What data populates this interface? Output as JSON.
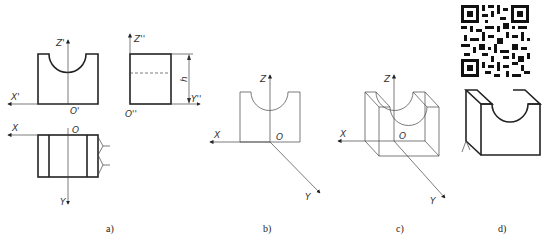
{
  "figure": {
    "panels": [
      {
        "id": "a",
        "caption": "a)",
        "description": "Three-view orthographic projection of a block with a semicircular notch",
        "views": {
          "front": {
            "axis_labels": {
              "x": "X'",
              "z": "Z'",
              "origin": "O'"
            }
          },
          "side": {
            "axis_labels": {
              "z": "Z''",
              "y": "Y''",
              "origin": "O''"
            },
            "dimension": "h"
          },
          "top": {
            "axis_labels": {
              "x": "X",
              "y": "Y",
              "origin": "O"
            }
          }
        }
      },
      {
        "id": "b",
        "caption": "b)",
        "description": "Oblique axes with front face drawn",
        "axis_labels": {
          "x": "X",
          "z": "Z",
          "y": "Y",
          "origin": "O"
        }
      },
      {
        "id": "c",
        "caption": "c)",
        "description": "Oblique axes with full wireframe of block",
        "axis_labels": {
          "x": "X",
          "z": "Z",
          "y": "Y",
          "origin": "O"
        }
      },
      {
        "id": "d",
        "caption": "d)",
        "description": "Finished oblique drawing with QR code",
        "qr_code": "qr-code-icon"
      }
    ]
  }
}
